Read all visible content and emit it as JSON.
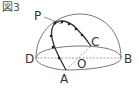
{
  "figure": {
    "title": "図3",
    "points": {
      "P": "P",
      "C": "C",
      "D": "D",
      "O": "O",
      "B": "B",
      "A": "A"
    },
    "colors": {
      "line": "#666666",
      "dashed": "#8a8a8a",
      "path": "#333333",
      "dot": "#222222",
      "text": "#333333"
    }
  }
}
